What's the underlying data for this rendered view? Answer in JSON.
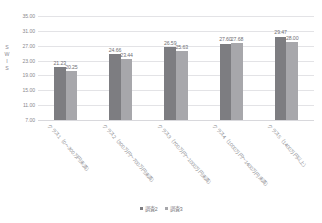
{
  "top_cut_fragments": [
    {
      "text": "※※※※※",
      "left": 150,
      "top": 0
    },
    {
      "text": "※※※※  ※※※※※  ※※※※",
      "left": 225,
      "top": 0
    }
  ],
  "chart_data": {
    "type": "bar",
    "title": "",
    "xlabel": "",
    "ylabel": "S W I S",
    "ylim": [
      7.0,
      35.0
    ],
    "ytick_labels": [
      "35.00",
      "31.00",
      "27.00",
      "23.00",
      "19.00",
      "15.00",
      "11.00",
      "7.00"
    ],
    "ytick_values": [
      35.0,
      31.0,
      27.0,
      23.0,
      19.0,
      15.0,
      11.0,
      7.0
    ],
    "grid": true,
    "legend_position": "bottom",
    "categories": [
      "クラス1（0～300万円未満）",
      "クラス2（300万円～700万円未満）",
      "クラス3（700万円～1000万円未満）",
      "クラス4（1000万円～1400万円未満）",
      "クラス5（1400万円以上）"
    ],
    "series": [
      {
        "name": "調査2",
        "color": "#7d7d81",
        "values": [
          21.23,
          24.66,
          26.59,
          27.6,
          29.47
        ],
        "labels": [
          "21.23",
          "24.66",
          "26.59",
          "27.60",
          "29.47"
        ]
      },
      {
        "name": "調査3",
        "color": "#a7a7ab",
        "values": [
          20.25,
          23.44,
          25.63,
          27.68,
          28.0
        ],
        "labels": [
          "20.25",
          "23.44",
          "25.63",
          "27.68",
          "28.00"
        ]
      }
    ]
  }
}
